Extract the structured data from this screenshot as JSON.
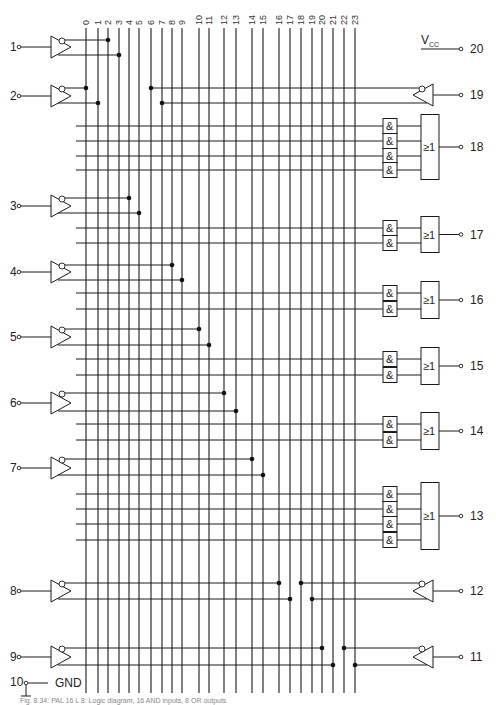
{
  "columns": {
    "labels": [
      "0",
      "1",
      "2",
      "3",
      "4",
      "5",
      "6",
      "7",
      "8",
      "9",
      "10",
      "11",
      "12",
      "13",
      "14",
      "15",
      "16",
      "17",
      "18",
      "19",
      "20",
      "21",
      "22",
      "23"
    ],
    "x": [
      86,
      98,
      108,
      119,
      129,
      139,
      151,
      162,
      172,
      182,
      199,
      209,
      224,
      236,
      252,
      263,
      279,
      290,
      301,
      312,
      322,
      333,
      344,
      355
    ],
    "top": 28,
    "bottom": 693
  },
  "input_buffers": [
    {
      "pin": "1",
      "y": 47,
      "out_true_y": 55,
      "out_inv_y": 40,
      "inv_col": 2,
      "true_col": 3,
      "side": "left"
    },
    {
      "pin": "2",
      "y": 96,
      "out_true_y": 103,
      "out_inv_y": 88,
      "inv_col": 0,
      "true_col": 1,
      "side": "left"
    },
    {
      "pin": "3",
      "y": 206,
      "out_true_y": 213,
      "out_inv_y": 198,
      "inv_col": 4,
      "true_col": 5,
      "side": "left"
    },
    {
      "pin": "4",
      "y": 272,
      "out_true_y": 280,
      "out_inv_y": 265,
      "inv_col": 8,
      "true_col": 9,
      "side": "left"
    },
    {
      "pin": "5",
      "y": 337,
      "out_true_y": 345,
      "out_inv_y": 329,
      "inv_col": 10,
      "true_col": 11,
      "side": "left"
    },
    {
      "pin": "6",
      "y": 403,
      "out_true_y": 411,
      "out_inv_y": 393,
      "inv_col": 12,
      "true_col": 13,
      "side": "left"
    },
    {
      "pin": "7",
      "y": 468,
      "out_true_y": 475,
      "out_inv_y": 459,
      "inv_col": 14,
      "true_col": 15,
      "side": "left"
    },
    {
      "pin": "8",
      "y": 591,
      "out_true_y": 599,
      "out_inv_y": 583,
      "inv_col": 16,
      "true_col": 17,
      "side": "left"
    },
    {
      "pin": "9",
      "y": 657,
      "out_true_y": 665,
      "out_inv_y": 648,
      "inv_col": 20,
      "true_col": 21,
      "side": "left"
    }
  ],
  "feedback_buffers": [
    {
      "pin": "19",
      "y": 95,
      "out_inv_y": 88,
      "out_true_y": 103,
      "inv_col": 6,
      "true_col": 7
    },
    {
      "pin": "12",
      "y": 591,
      "out_inv_y": 583,
      "out_true_y": 599,
      "inv_col": 18,
      "true_col": 19
    },
    {
      "pin": "11",
      "y": 657,
      "out_inv_y": 648,
      "out_true_y": 665,
      "inv_col": 22,
      "true_col": 23
    }
  ],
  "output_groups": [
    {
      "pin": "18",
      "terms_y": [
        126,
        141,
        156,
        170
      ],
      "or_label": "≥1",
      "and_label": "&"
    },
    {
      "pin": "17",
      "terms_y": [
        228,
        243
      ],
      "or_label": "≥1",
      "and_label": "&"
    },
    {
      "pin": "16",
      "terms_y": [
        293,
        309
      ],
      "or_label": "≥1",
      "and_label": "&"
    },
    {
      "pin": "15",
      "terms_y": [
        359,
        375
      ],
      "or_label": "≥1",
      "and_label": "&"
    },
    {
      "pin": "14",
      "terms_y": [
        424,
        440
      ],
      "or_label": "≥1",
      "and_label": "&"
    },
    {
      "pin": "13",
      "terms_y": [
        494,
        509,
        524,
        540
      ],
      "or_label": "≥1",
      "and_label": "&"
    }
  ],
  "power": {
    "vcc_label": "V",
    "vcc_sub": "CC",
    "vcc_pin": "20",
    "gnd_label": "GND",
    "gnd_pin": "10"
  },
  "caption": "Fig. 8.34: PAL 16 L 8: Logic diagram, 16 AND inputs, 8 OR outputs"
}
